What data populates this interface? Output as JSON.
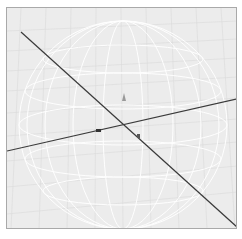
{
  "viewport": {
    "background_color": "#ececec",
    "border_color": "#a9a9a9",
    "grid_color": "#dcdcdc",
    "wireframe_color": "#ffffff",
    "axis_color": "#333333",
    "object": "wireframe-sphere",
    "axes": [
      {
        "name": "axis-line-diagonal",
        "from": [
          15,
          26
        ],
        "to": [
          236,
          227
        ]
      },
      {
        "name": "axis-line-horizontal",
        "from": [
          6,
          150
        ],
        "to": [
          236,
          92
        ]
      }
    ]
  }
}
